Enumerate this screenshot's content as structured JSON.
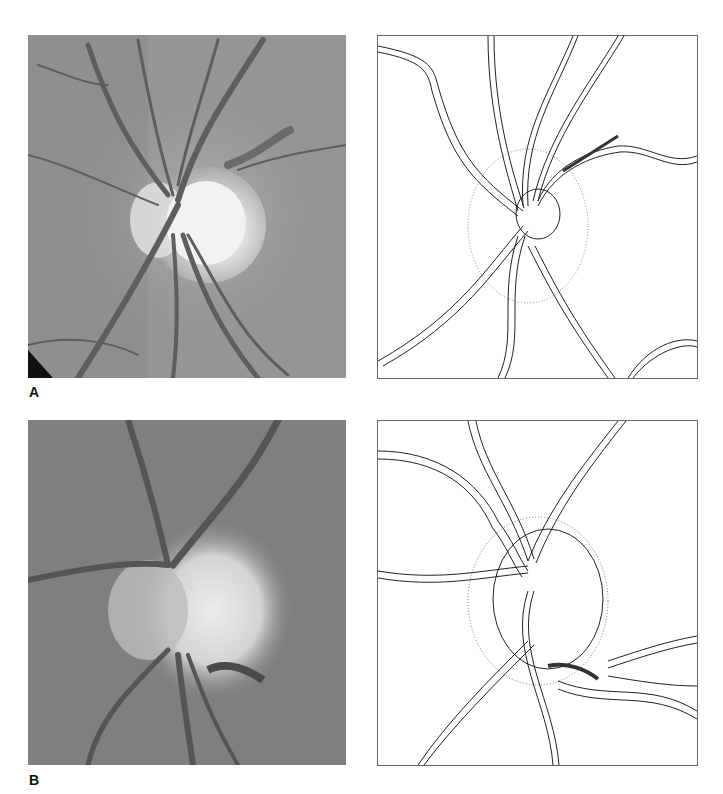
{
  "figure": {
    "panels": [
      {
        "id": "A",
        "label": "A",
        "photo_description": "Fundus photograph of optic disc with retinal vessels",
        "drawing_description": "Line drawing tracing of optic disc and retinal vessels with peripapillary stippling and hemorrhage hatching"
      },
      {
        "id": "B",
        "label": "B",
        "photo_description": "Fundus photograph of optic disc with notch and splinter hemorrhage inferotemporally",
        "drawing_description": "Line drawing tracing of optic disc with hatched rim defect and vessels"
      }
    ]
  }
}
